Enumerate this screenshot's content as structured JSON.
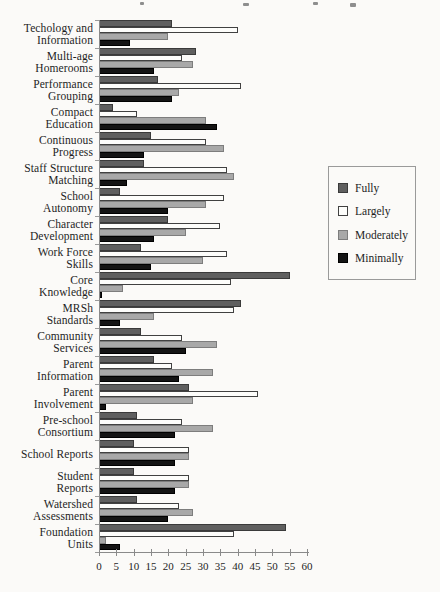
{
  "chart_data": {
    "type": "bar",
    "orientation": "horizontal",
    "title": "",
    "xlabel": "",
    "ylabel": "",
    "xlim": [
      0,
      60
    ],
    "x_ticks": [
      0,
      5,
      10,
      15,
      20,
      25,
      30,
      35,
      40,
      45,
      50,
      55,
      60
    ],
    "grid": false,
    "legend_position": "right",
    "categories": [
      "Techology and Information",
      "Multi-age Homerooms",
      "Performance Grouping",
      "Compact Education",
      "Continuous Progress",
      "Staff Structure Matching",
      "School Autonomy",
      "Character Development",
      "Work Force Skills",
      "Core Knowledge",
      "MRSh Standards",
      "Community Services",
      "Parent Information",
      "Parent Involvement",
      "Pre-school Consortium",
      "School Reports",
      "Student Reports",
      "Watershed Assessments",
      "Foundation Units"
    ],
    "category_label_lines": [
      [
        "Techology and",
        "Information"
      ],
      [
        "Multi-age",
        "Homerooms"
      ],
      [
        "Performance",
        "Grouping"
      ],
      [
        "Compact",
        "Education"
      ],
      [
        "Continuous",
        "Progress"
      ],
      [
        "Staff Structure",
        "Matching"
      ],
      [
        "School",
        "Autonomy"
      ],
      [
        "Character",
        "Development"
      ],
      [
        "Work Force",
        "Skills"
      ],
      [
        "Core",
        "Knowledge"
      ],
      [
        "MRSh",
        "Standards"
      ],
      [
        "Community",
        "Services"
      ],
      [
        "Parent",
        "Information"
      ],
      [
        "Parent",
        "Involvement"
      ],
      [
        "Pre-school",
        "Consortium"
      ],
      [
        "School Reports"
      ],
      [
        "Student",
        "Reports"
      ],
      [
        "Watershed",
        "Assessments"
      ],
      [
        "Foundation",
        "Units"
      ]
    ],
    "series": [
      {
        "name": "Fully",
        "color": "#5f5f5f",
        "values": [
          21,
          28,
          17,
          4,
          15,
          13,
          6,
          20,
          12,
          55,
          41,
          12,
          16,
          26,
          11,
          10,
          10,
          11,
          54
        ]
      },
      {
        "name": "Largely",
        "color": "#fdfdfb",
        "values": [
          40,
          24,
          41,
          11,
          31,
          37,
          36,
          35,
          37,
          38,
          39,
          24,
          21,
          46,
          24,
          26,
          26,
          23,
          39
        ]
      },
      {
        "name": "Moderately",
        "color": "#a8a8a8",
        "values": [
          20,
          27,
          23,
          31,
          36,
          39,
          31,
          25,
          30,
          7,
          16,
          34,
          33,
          27,
          33,
          26,
          26,
          27,
          2
        ]
      },
      {
        "name": "Minimally",
        "color": "#141414",
        "values": [
          9,
          16,
          21,
          34,
          13,
          8,
          20,
          16,
          15,
          1,
          6,
          25,
          23,
          2,
          22,
          22,
          22,
          20,
          6
        ]
      }
    ]
  },
  "legend": {
    "labels": [
      "Fully",
      "Largely",
      "Moderately",
      "Minimally"
    ]
  }
}
